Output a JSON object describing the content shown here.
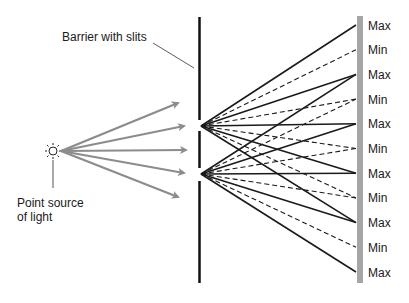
{
  "labels": {
    "barrier": "Barrier with slits",
    "source_line1": "Point source",
    "source_line2": "of light"
  },
  "screen_labels": [
    "Max",
    "Min",
    "Max",
    "Min",
    "Max",
    "Min",
    "Max",
    "Min",
    "Max",
    "Min",
    "Max"
  ],
  "colors": {
    "arrow": "#8c8c8c",
    "barrier": "#111111",
    "rays": "#1a1a1a",
    "screen": "#a6a6a6"
  }
}
